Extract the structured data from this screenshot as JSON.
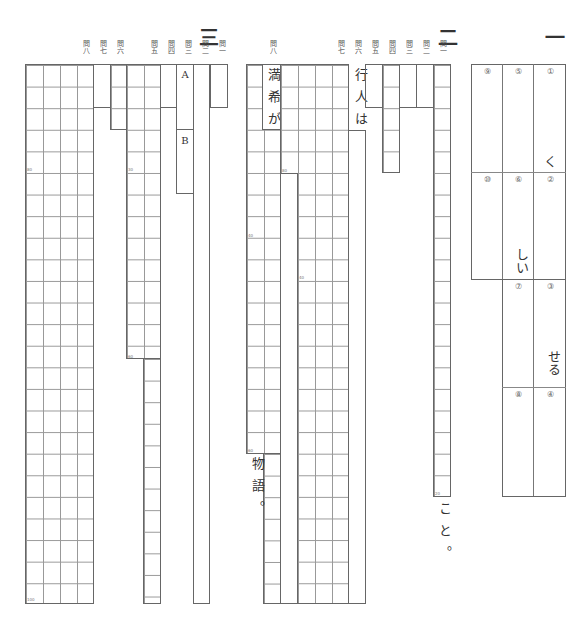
{
  "sections": {
    "one": {
      "marker": "一",
      "slots": [
        {
          "no": "①",
          "answer": "く"
        },
        {
          "no": "②",
          "answer": ""
        },
        {
          "no": "③",
          "answer": "せる"
        },
        {
          "no": "④",
          "answer": ""
        },
        {
          "no": "⑤",
          "answer": ""
        },
        {
          "no": "⑥",
          "answer": "しい"
        },
        {
          "no": "⑦",
          "answer": ""
        },
        {
          "no": "⑧",
          "answer": ""
        },
        {
          "no": "⑨",
          "answer": ""
        },
        {
          "no": "⑩",
          "answer": ""
        }
      ]
    },
    "two": {
      "marker": "二",
      "questions": {
        "q1": "問一",
        "q2": "問二",
        "q3": "問三",
        "q4": "問四",
        "q5": "問五",
        "q6": "問六",
        "q7": "問七",
        "q8": "問八"
      },
      "q1_suffix": "こと。",
      "q6_prefix": "行人は",
      "q8_prefix": "満希が",
      "q8_suffix": "物語。",
      "counters": {
        "q1": "20",
        "q7a": "80",
        "q7b": "40",
        "q8a": "20",
        "q8b": "40",
        "q8c": "60"
      }
    },
    "three": {
      "marker": "三",
      "questions": {
        "q1": "問一",
        "q2": "問二",
        "q3": "問三",
        "q4": "問四",
        "q5": "問五",
        "q6": "問六",
        "q7": "問七",
        "q8": "問八"
      },
      "q3_labels": {
        "a": "A",
        "b": "B"
      },
      "counters": {
        "q5a": "30",
        "q5b": "60",
        "q8a": "80",
        "q8b": "100"
      }
    }
  }
}
